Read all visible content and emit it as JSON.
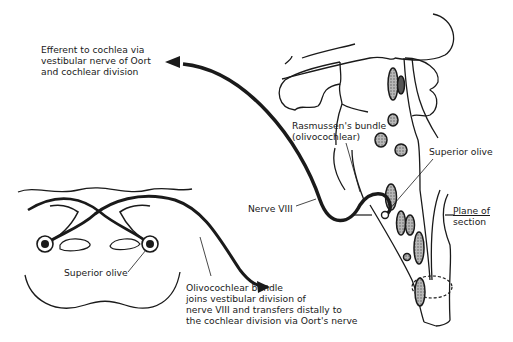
{
  "diagram": {
    "colors": {
      "ink": "#1a1a1a",
      "nucleus_fill": "#9a9a9a",
      "background": "#ffffff"
    },
    "labels": {
      "efferent": {
        "line1": "Efferent to cochlea via",
        "line2": "vestibular nerve of Oort",
        "line3": "and cochlear division"
      },
      "rasmussen": {
        "line1": "Rasmussen's bundle",
        "line2": "(olivocochlear)"
      },
      "superior_olive_right": "Superior olive",
      "nerve_viii": "Nerve VIII",
      "plane_of_section": {
        "line1": "Plane of",
        "line2": "section"
      },
      "superior_olive_left": "Superior olive",
      "olivocochlear_bundle": {
        "line1": "Olivocochlear bundle",
        "line2": "joins vestibular division of",
        "line3": "nerve VIII and transfers distally to",
        "line4": "the cochlear division via Oort's nerve"
      }
    },
    "panels": [
      {
        "name": "cross-section",
        "description": "Transverse section of brainstem showing crossing olivocochlear fibers between bilateral superior olives"
      },
      {
        "name": "sagittal-view",
        "description": "Lateral view of brainstem with Rasmussen's bundle exiting via Nerve VIII"
      }
    ]
  }
}
